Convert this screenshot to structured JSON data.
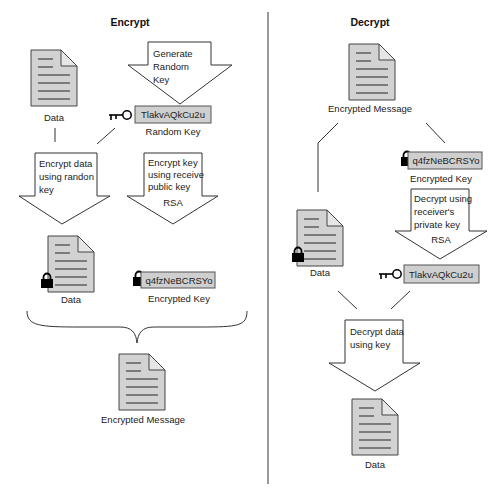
{
  "encrypt": {
    "title": "Encrypt",
    "data_doc_label": "Data",
    "generate_arrow": [
      "Generate",
      "Random",
      "Key"
    ],
    "random_key_value": "TlakvAQkCu2u",
    "random_key_label": "Random Key",
    "encrypt_data_arrow": [
      "Encrypt data",
      "using randon",
      "key"
    ],
    "encrypt_key_arrow": [
      "Encrypt key",
      "using receive",
      "public key"
    ],
    "encrypt_key_algo": "RSA",
    "encrypted_data_label": "Data",
    "encrypted_key_value": "q4fzNeBCRSYo",
    "encrypted_key_label": "Encrypted Key",
    "output_label": "Encrypted Message"
  },
  "decrypt": {
    "title": "Decrypt",
    "input_label": "Encrypted Message",
    "encrypted_key_value": "q4fzNeBCRSYo",
    "encrypted_key_label": "Encrypted Key",
    "decrypt_key_arrow": [
      "Decrypt using",
      "receiver's",
      "private key"
    ],
    "decrypt_key_algo": "RSA",
    "encrypted_data_label": "Data",
    "random_key_value": "TlakvAQkCu2u",
    "decrypt_data_arrow": [
      "Decrypt data",
      "using key"
    ],
    "output_label": "Data"
  },
  "icons": {
    "document": "document-icon",
    "key": "key-icon",
    "lock": "padlock-icon"
  },
  "colors": {
    "doc_fill": "#d2d2d2",
    "keybox_fill": "#cfcfcf",
    "stroke": "#333333"
  }
}
